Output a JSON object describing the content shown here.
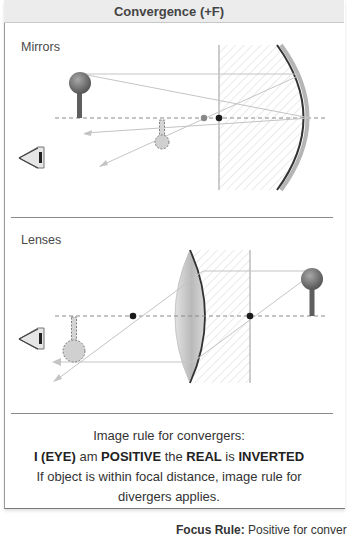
{
  "header": {
    "title": "Convergence (+F)"
  },
  "mirrors": {
    "label": "Mirrors",
    "icons": [
      "eye-icon",
      "object-ball-icon",
      "image-ball-icon",
      "concave-mirror-icon"
    ],
    "focal_points": [
      "F (gray)",
      "C (black)"
    ]
  },
  "lenses": {
    "label": "Lenses",
    "icons": [
      "eye-icon",
      "object-ball-icon",
      "image-ball-icon",
      "convex-lens-icon"
    ],
    "focal_points": [
      "F1",
      "F2"
    ]
  },
  "rule": {
    "line1": "Image rule for convergers:",
    "line2": {
      "w1": "I (EYE)",
      "w2": " am ",
      "w3": "POSITIVE",
      "w4": " the ",
      "w5": "REAL",
      "w6": " is ",
      "w7": "INVERTED"
    },
    "line3": "If object is within focal distance, image rule for",
    "line4": "divergers applies."
  },
  "focus": {
    "label": "Focus Rule:",
    "text": " Positive for conver"
  },
  "colors": {
    "header_bg": "#ececec",
    "ray": "#c4c4c4",
    "axis": "#8a8a8a",
    "object": "#6e6e6e",
    "image_fill": "#cfcfcf",
    "focal_dot": "#1a1a1a",
    "hatch": "#d6d6d6"
  }
}
